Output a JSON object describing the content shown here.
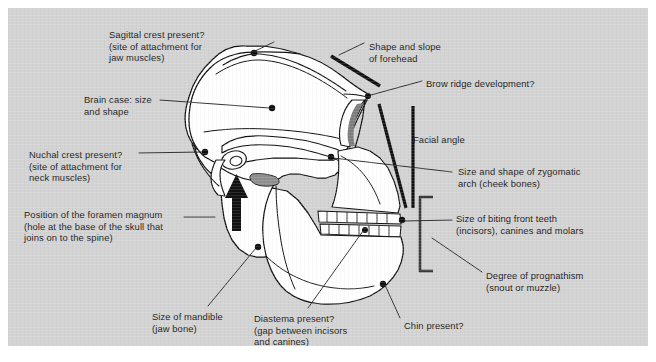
{
  "figure": {
    "panel_color": "#d3d3d3",
    "ink_color": "#1b1b1b",
    "bone_fill": "#ffffff",
    "page_background": "#ffffff"
  },
  "labels": [
    {
      "id": "sagittal-crest",
      "lines": [
        "Sagittal crest present?",
        "(site of attachment for",
        "jaw muscles)"
      ],
      "x": 101,
      "y": 21,
      "align": "left"
    },
    {
      "id": "brain-case",
      "lines": [
        "Brain case: size",
        "and shape"
      ],
      "x": 76,
      "y": 86,
      "align": "left"
    },
    {
      "id": "nuchal-crest",
      "lines": [
        "Nuchal crest present?",
        "(site of attachment for",
        "neck muscles)"
      ],
      "x": 21,
      "y": 141,
      "align": "left"
    },
    {
      "id": "foramen-magnum",
      "lines": [
        "Position of the foramen magnum",
        "(hole at the base of the skull that",
        "joins on to the spine)"
      ],
      "x": 16,
      "y": 201,
      "align": "left"
    },
    {
      "id": "mandible",
      "lines": [
        "Size of mandible",
        "(jaw bone)"
      ],
      "x": 144,
      "y": 303,
      "align": "left"
    },
    {
      "id": "diastema",
      "lines": [
        "Diastema present?",
        "(gap between incisors",
        "and canines)"
      ],
      "x": 246,
      "y": 305,
      "align": "left"
    },
    {
      "id": "chin",
      "lines": [
        "Chin present?"
      ],
      "x": 396,
      "y": 312,
      "align": "left"
    },
    {
      "id": "forehead",
      "lines": [
        "Shape and slope",
        "of forehead"
      ],
      "x": 361,
      "y": 33,
      "align": "left"
    },
    {
      "id": "brow-ridge",
      "lines": [
        "Brow ridge development?"
      ],
      "x": 418,
      "y": 70,
      "align": "left"
    },
    {
      "id": "facial-angle",
      "lines": [
        "Facial angle"
      ],
      "x": 405,
      "y": 126,
      "align": "left"
    },
    {
      "id": "zygomatic-arch",
      "lines": [
        "Size and shape of zygomatic",
        "arch (cheek bones)"
      ],
      "x": 450,
      "y": 158,
      "align": "left"
    },
    {
      "id": "front-teeth",
      "lines": [
        "Size of biting front teeth",
        "(incisors), canines and molars"
      ],
      "x": 448,
      "y": 205,
      "align": "left"
    },
    {
      "id": "prognathism",
      "lines": [
        "Degree of prognathism",
        "(snout or muzzle)",
        ""
      ],
      "x": 478,
      "y": 262,
      "align": "left"
    }
  ],
  "annotation_points": [
    {
      "id": "point-sagittal-crest",
      "x": 246,
      "y": 45
    },
    {
      "id": "point-brain-case",
      "x": 264,
      "y": 100
    },
    {
      "id": "point-nuchal-crest",
      "x": 198,
      "y": 144
    },
    {
      "id": "point-brow-ridge",
      "x": 360,
      "y": 88
    },
    {
      "id": "point-zygomatic-arch",
      "x": 323,
      "y": 149
    },
    {
      "id": "point-foramen-magnum",
      "x": 250,
      "y": 238
    },
    {
      "id": "point-diastema",
      "x": 357,
      "y": 222
    },
    {
      "id": "point-front-teeth",
      "x": 394,
      "y": 213
    },
    {
      "id": "point-chin",
      "x": 375,
      "y": 275
    }
  ],
  "leader_lines": [
    {
      "id": "leader-sagittal-crest",
      "from": [
        243,
        47
      ],
      "to": [
        264,
        35
      ]
    },
    {
      "id": "leader-brain-case",
      "from": [
        262,
        101
      ],
      "to": [
        152,
        93
      ]
    },
    {
      "id": "leader-nuchal-crest",
      "from": [
        195,
        144
      ],
      "to": [
        131,
        145
      ]
    },
    {
      "id": "leader-brow-ridge",
      "from": [
        362,
        88
      ],
      "to": [
        414,
        73
      ]
    },
    {
      "id": "leader-zygomatic-arch",
      "from": [
        325,
        150
      ],
      "to": [
        444,
        164
      ]
    },
    {
      "id": "leader-foramen-magnum",
      "from": [
        207,
        209
      ],
      "to": [
        178,
        209
      ]
    },
    {
      "id": "leader-mandible",
      "from": [
        248,
        240
      ],
      "to": [
        200,
        298
      ]
    },
    {
      "id": "leader-diastema",
      "from": [
        355,
        223
      ],
      "to": [
        300,
        300
      ]
    },
    {
      "id": "leader-front-teeth",
      "from": [
        397,
        213
      ],
      "to": [
        444,
        213
      ]
    },
    {
      "id": "leader-prognathism",
      "from": [
        424,
        230
      ],
      "to": [
        474,
        265
      ]
    },
    {
      "id": "leader-chin",
      "from": [
        377,
        277
      ],
      "to": [
        392,
        311
      ]
    },
    {
      "id": "leader-forehead",
      "from": [
        357,
        35
      ],
      "to": [
        331,
        47
      ]
    }
  ],
  "markers": {
    "forehead_slope_bar": {
      "from": [
        323,
        48
      ],
      "to": [
        372,
        78
      ],
      "width": 3.4
    },
    "facial_angle_line_a": {
      "from": [
        371,
        96
      ],
      "to": [
        396,
        200
      ],
      "width": 3.0
    },
    "facial_angle_line_b": {
      "from": [
        404,
        98
      ],
      "to": [
        404,
        200
      ],
      "width": 3.0
    },
    "foramen_arrow": {
      "x": 228,
      "y_top": 170,
      "y_bottom": 222
    },
    "prognathism_bracket": {
      "x": 411,
      "y_top": 188,
      "y_bottom": 264,
      "arm": 14
    }
  },
  "icons": {
    "annotation_dot": "filled-circle-marker",
    "direction_arrow": "up-arrow-icon",
    "measure_bracket": "square-bracket-icon"
  }
}
